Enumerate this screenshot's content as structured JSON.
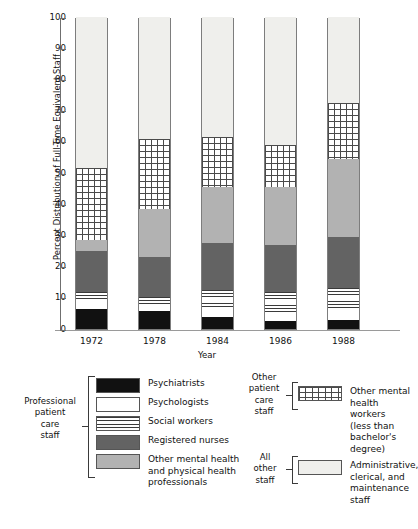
{
  "chart_data": {
    "type": "bar",
    "stacked": true,
    "title": "",
    "xlabel": "Year",
    "ylabel": "Percent Distribution of Full-Time Equivalent Staff",
    "categories": [
      "1972",
      "1978",
      "1984",
      "1986",
      "1988"
    ],
    "ylim": [
      0,
      100
    ],
    "yticks": [
      "0",
      "10",
      "20",
      "30",
      "40",
      "50",
      "60",
      "70",
      "80",
      "90",
      "100"
    ],
    "grid": false,
    "legend_position": "below",
    "series": [
      {
        "name": "Psychiatrists",
        "key": "psychiatrists",
        "color": "#111111",
        "values": [
          6.5,
          5.8,
          4.0,
          2.5,
          3.0
        ]
      },
      {
        "name": "Psychologists",
        "key": "psychologists",
        "color": "#ffffff",
        "values": [
          2.5,
          2.0,
          3.0,
          3.0,
          3.0
        ]
      },
      {
        "name": "Social workers",
        "key": "social_workers",
        "color": "#ffffff-striped",
        "values": [
          3.0,
          2.5,
          5.5,
          6.5,
          7.0
        ]
      },
      {
        "name": "Registered nurses",
        "key": "registered_nurses",
        "color": "#636363",
        "values": [
          13.0,
          12.7,
          15.0,
          15.0,
          16.5
        ]
      },
      {
        "name": "Other mental health and physical health professionals",
        "key": "other_professionals",
        "color": "#b2b2b2",
        "values": [
          3.5,
          15.5,
          18.0,
          18.5,
          25.0
        ]
      },
      {
        "name": "Other mental health workers (less than bachelor's degree)",
        "key": "other_mh_workers",
        "color": "#ffffff-grid",
        "values": [
          23.0,
          22.5,
          16.0,
          13.5,
          18.0
        ]
      },
      {
        "name": "Administrative, clerical, and maintenance staff",
        "key": "admin_clerical",
        "color": "#efefec",
        "values": [
          48.5,
          39.0,
          38.5,
          41.0,
          27.5
        ]
      }
    ],
    "cumulative_tops": {
      "1972": [
        6.5,
        9.0,
        12.0,
        25.0,
        28.5,
        51.5,
        100
      ],
      "1978": [
        5.8,
        7.8,
        10.3,
        23.0,
        38.5,
        61.0,
        100
      ],
      "1984": [
        4.0,
        7.0,
        12.5,
        27.5,
        45.5,
        61.5,
        100
      ],
      "1986": [
        2.5,
        5.5,
        12.0,
        27.0,
        45.5,
        59.0,
        100
      ],
      "1988": [
        3.0,
        6.0,
        13.0,
        29.5,
        54.5,
        72.5,
        100
      ]
    }
  },
  "legend": {
    "groups": [
      {
        "bracket_label": "Professional\npatient\ncare\nstaff",
        "bracket_lines": [
          "Professional",
          "patient",
          "care",
          "staff"
        ],
        "items": [
          {
            "label": "Psychiatrists",
            "swatch": "sw-black"
          },
          {
            "label": "Psychologists",
            "swatch": "sw-white"
          },
          {
            "label": "Social workers",
            "swatch": "sw-striped"
          },
          {
            "label": "Registered nurses",
            "swatch": "sw-dark"
          },
          {
            "label": "Other mental health\nand physical health\nprofessionals",
            "swatch": "sw-gray"
          }
        ]
      },
      {
        "bracket_lines": [
          "Other",
          "patient",
          "care",
          "staff"
        ],
        "items": [
          {
            "label": "Other mental\nhealth workers\n(less than bachelor's\ndegree)",
            "swatch": "sw-hatch"
          }
        ]
      },
      {
        "bracket_lines": [
          "All",
          "other",
          "staff"
        ],
        "items": [
          {
            "label": "Administrative,\nclerical, and\nmaintenance\nstaff",
            "swatch": "sw-light"
          }
        ]
      }
    ],
    "left_bracket_lines": "Professional\npatient\ncare\nstaff",
    "mid_bracket_lines": "Other\npatient\ncare\nstaff",
    "right_bracket_lines": "All\nother\nstaff",
    "item_psychiatrists": "Psychiatrists",
    "item_psychologists": "Psychologists",
    "item_social_workers": "Social workers",
    "item_registered_nurses": "Registered nurses",
    "item_other_professionals_l1": "Other mental health",
    "item_other_professionals_l2": "and physical health",
    "item_other_professionals_l3": "professionals",
    "item_other_mh_l1": "Other mental",
    "item_other_mh_l2": "health workers",
    "item_other_mh_l3": "(less than bachelor's",
    "item_other_mh_l4": "degree)",
    "item_admin_l1": "Administrative,",
    "item_admin_l2": "clerical, and",
    "item_admin_l3": "maintenance",
    "item_admin_l4": "staff",
    "brk_prof_l1": "Professional",
    "brk_prof_l2": "patient",
    "brk_prof_l3": "care",
    "brk_prof_l4": "staff",
    "brk_other_l1": "Other",
    "brk_other_l2": "patient",
    "brk_other_l3": "care",
    "brk_other_l4": "staff",
    "brk_all_l1": "All",
    "brk_all_l2": "other",
    "brk_all_l3": "staff"
  }
}
